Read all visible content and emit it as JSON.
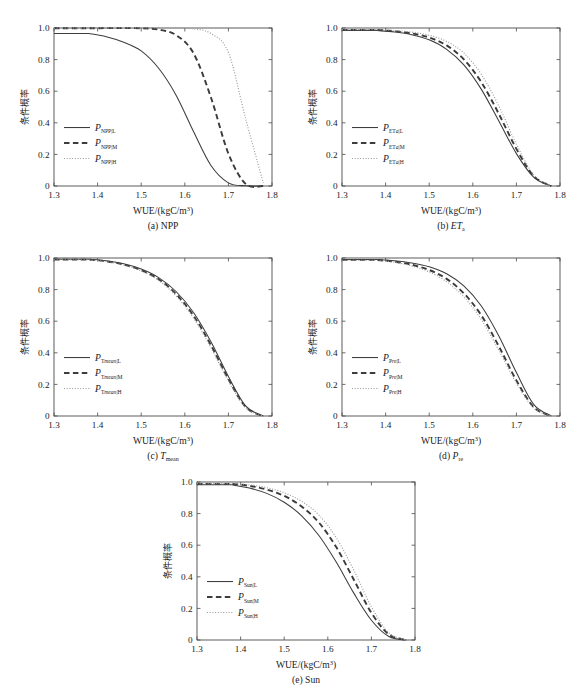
{
  "figure": {
    "width": 570,
    "height": 685,
    "background": "#ffffff",
    "curve_colors": {
      "solid": "#3d3d3d",
      "dashed": "#3a3a3a",
      "dotted": "#9a9a9a"
    }
  },
  "axes": {
    "xlabel_main": "WUE/(kgC/m",
    "xlabel_sup": "3",
    "xlabel_tail": ")",
    "ylabel": "条件概率",
    "xticks": [
      "1.3",
      "1.4",
      "1.5",
      "1.6",
      "1.7",
      "1.8"
    ],
    "yticks": [
      "0",
      "0.2",
      "0.4",
      "0.6",
      "0.8",
      "1.0"
    ],
    "xlim": [
      1.3,
      1.8
    ],
    "ylim": [
      0,
      1
    ]
  },
  "chart_data": {
    "type": "line",
    "title": "",
    "xlabel": "WUE/(kgC/m3)",
    "ylabel": "条件概率 (conditional probability)",
    "xlim": [
      1.3,
      1.8
    ],
    "ylim": [
      0,
      1.0
    ],
    "grid": false,
    "legend_position": "inner-left",
    "x": [
      1.38,
      1.42,
      1.46,
      1.5,
      1.54,
      1.58,
      1.62,
      1.66,
      1.7,
      1.74,
      1.78
    ],
    "panels": [
      {
        "id": "a",
        "caption_prefix": "(a)",
        "caption_var": "NPP",
        "caption_sub": "",
        "series": [
          {
            "name": "P_NPP|L",
            "style": "solid",
            "sub_main": "NPP|",
            "sub_tail": "L",
            "values": [
              0.965,
              0.945,
              0.91,
              0.855,
              0.745,
              0.575,
              0.345,
              0.13,
              0.02,
              0.001,
              0.0
            ]
          },
          {
            "name": "P_NPP|M",
            "style": "dashed",
            "sub_main": "NPP|",
            "sub_tail": "M",
            "values": [
              0.998,
              0.999,
              0.999,
              0.998,
              0.99,
              0.955,
              0.84,
              0.56,
              0.205,
              0.012,
              0.0
            ]
          },
          {
            "name": "P_NPP|H",
            "style": "dotted",
            "sub_main": "NPP|",
            "sub_tail": "H",
            "values": [
              0.999,
              1.0,
              1.0,
              1.0,
              1.0,
              0.999,
              0.995,
              0.965,
              0.845,
              0.42,
              0.02
            ]
          }
        ]
      },
      {
        "id": "b",
        "caption_prefix": "(b)",
        "caption_var": "ET",
        "caption_sub": "a",
        "series": [
          {
            "name": "P_ETa|L",
            "style": "solid",
            "sub_main": "ET",
            "sub_it": "a",
            "sub_tail": "|L",
            "values": [
              0.985,
              0.975,
              0.958,
              0.925,
              0.865,
              0.765,
              0.61,
              0.41,
              0.205,
              0.055,
              0.0
            ]
          },
          {
            "name": "P_ETa|M",
            "style": "dashed",
            "sub_main": "ET",
            "sub_it": "a",
            "sub_tail": "|M",
            "values": [
              0.988,
              0.98,
              0.966,
              0.94,
              0.89,
              0.8,
              0.655,
              0.455,
              0.235,
              0.062,
              0.0
            ]
          },
          {
            "name": "P_ETa|H",
            "style": "dotted",
            "sub_main": "ET",
            "sub_it": "a",
            "sub_tail": "|H",
            "values": [
              0.99,
              0.984,
              0.974,
              0.954,
              0.915,
              0.84,
              0.705,
              0.505,
              0.265,
              0.07,
              0.0
            ]
          }
        ]
      },
      {
        "id": "c",
        "caption_prefix": "(c)",
        "caption_var": "T",
        "caption_sub": "mean",
        "series": [
          {
            "name": "P_Tmean|L",
            "style": "solid",
            "sub_main": "T",
            "sub_it": "mean",
            "sub_tail": "|L",
            "values": [
              0.992,
              0.982,
              0.963,
              0.93,
              0.876,
              0.788,
              0.655,
              0.47,
              0.25,
              0.062,
              0.0
            ]
          },
          {
            "name": "P_Tmean|M",
            "style": "dashed",
            "sub_main": "T",
            "sub_it": "mean",
            "sub_tail": "|M",
            "values": [
              0.99,
              0.979,
              0.958,
              0.923,
              0.866,
              0.772,
              0.635,
              0.448,
              0.234,
              0.056,
              0.0
            ]
          },
          {
            "name": "P_Tmean|H",
            "style": "dotted",
            "sub_main": "T",
            "sub_it": "mean",
            "sub_tail": "|H",
            "values": [
              0.989,
              0.977,
              0.955,
              0.918,
              0.858,
              0.76,
              0.62,
              0.432,
              0.222,
              0.052,
              0.0
            ]
          }
        ]
      },
      {
        "id": "d",
        "caption_prefix": "(d)",
        "caption_var": "P",
        "caption_sub": "re",
        "series": [
          {
            "name": "P_Pre|L",
            "style": "solid",
            "sub_main": "P",
            "sub_it": "re",
            "sub_tail": "|L",
            "values": [
              0.99,
              0.982,
              0.968,
              0.944,
              0.9,
              0.822,
              0.695,
              0.505,
              0.275,
              0.072,
              0.0
            ]
          },
          {
            "name": "P_Pre|M",
            "style": "dashed",
            "sub_main": "P",
            "sub_it": "re",
            "sub_tail": "|M",
            "values": [
              0.988,
              0.977,
              0.957,
              0.924,
              0.868,
              0.775,
              0.635,
              0.44,
              0.225,
              0.055,
              0.0
            ]
          },
          {
            "name": "P_Pre|H",
            "style": "dotted",
            "sub_main": "P",
            "sub_it": "re",
            "sub_tail": "|H",
            "values": [
              0.986,
              0.973,
              0.95,
              0.912,
              0.85,
              0.752,
              0.608,
              0.415,
              0.208,
              0.05,
              0.0
            ]
          }
        ]
      },
      {
        "id": "e",
        "caption_prefix": "(e)",
        "caption_var": "Sun",
        "caption_sub": "",
        "series": [
          {
            "name": "P_Sun|L",
            "style": "solid",
            "sub_main": "Sun|",
            "sub_tail": "L",
            "values": [
              0.982,
              0.962,
              0.928,
              0.872,
              0.786,
              0.66,
              0.49,
              0.295,
              0.125,
              0.022,
              0.0
            ]
          },
          {
            "name": "P_Sun|M",
            "style": "dashed",
            "sub_main": "Sun|",
            "sub_tail": "M",
            "values": [
              0.988,
              0.976,
              0.952,
              0.912,
              0.845,
              0.742,
              0.585,
              0.38,
              0.172,
              0.035,
              0.0
            ]
          },
          {
            "name": "P_Sun|H",
            "style": "dotted",
            "sub_main": "Sun|",
            "sub_tail": "H",
            "values": [
              0.991,
              0.982,
              0.964,
              0.932,
              0.878,
              0.79,
              0.645,
              0.44,
              0.21,
              0.045,
              0.0
            ]
          }
        ]
      }
    ]
  }
}
